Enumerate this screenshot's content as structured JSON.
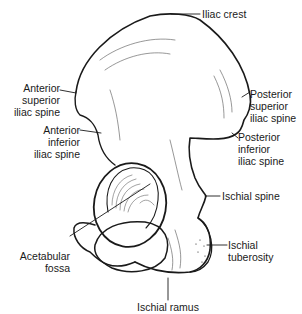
{
  "figure": {
    "stroke_color": "#1a1a1a",
    "background": "#ffffff"
  },
  "labels": {
    "iliac_crest": "Iliac crest",
    "asis": [
      "Anterior",
      "superior",
      "iliac spine"
    ],
    "aiis": [
      "Anterior",
      "inferior",
      "iliac spine"
    ],
    "psis": [
      "Posterior",
      "superior",
      "iliac spine"
    ],
    "piis": [
      "Posterior",
      "inferior",
      "iliac spine"
    ],
    "ischial_spine": "Ischial spine",
    "acetabular_fossa": [
      "Acetabular",
      "fossa"
    ],
    "ischial_tuberosity": [
      "Ischial",
      "tuberosity"
    ],
    "ischial_ramus": "Ischial ramus"
  }
}
